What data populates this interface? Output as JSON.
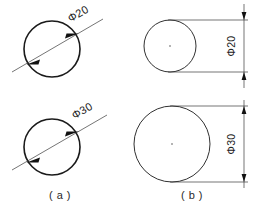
{
  "figure": {
    "background_color": "#ffffff",
    "line_color": "#1a1a1a",
    "dim_line_color": "#3a3a3a"
  },
  "panels": [
    {
      "id": "a",
      "caption": "( a )",
      "method": "diagonal diameter dimension through circle",
      "items": [
        {
          "label": "Φ20",
          "symbol": "Φ",
          "value": "20",
          "circle": {
            "cx": 52,
            "cy": 49,
            "r": 28
          },
          "dimension_angle_deg": -30,
          "arrow_direction": "inward"
        },
        {
          "label": "Φ30",
          "symbol": "Φ",
          "value": "30",
          "circle": {
            "cx": 52,
            "cy": 147,
            "r": 28
          },
          "dimension_angle_deg": -30,
          "arrow_direction": "inward"
        }
      ]
    },
    {
      "id": "b",
      "caption": "( b )",
      "method": "offset vertical dimension with extension lines",
      "items": [
        {
          "label": "Φ20",
          "symbol": "Φ",
          "value": "20",
          "circle": {
            "cx": 170,
            "cy": 46,
            "r": 26
          },
          "dimension_line_x": 244,
          "text_rotation_deg": -90,
          "arrow_direction": "inward",
          "has_center_mark": true
        },
        {
          "label": "Φ30",
          "symbol": "Φ",
          "value": "30",
          "circle": {
            "cx": 172,
            "cy": 144,
            "r": 38
          },
          "dimension_line_x": 244,
          "text_rotation_deg": -90,
          "arrow_direction": "inward",
          "has_center_mark": true
        }
      ]
    }
  ]
}
